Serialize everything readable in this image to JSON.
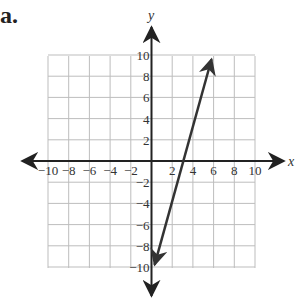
{
  "problem_label": "a.",
  "chart_data": {
    "type": "line",
    "title": "",
    "xlabel": "x",
    "ylabel": "y",
    "xlim": [
      -10,
      10
    ],
    "ylim": [
      -10,
      10
    ],
    "grid": true,
    "grid_step": 2,
    "x_ticks": [
      "−10",
      "−8",
      "−6",
      "−4",
      "−2",
      "2",
      "4",
      "6",
      "8",
      "10"
    ],
    "y_ticks": [
      "10",
      "8",
      "6",
      "4",
      "2",
      "−2",
      "−4",
      "−6",
      "−8",
      "−10"
    ],
    "series": [
      {
        "name": "line",
        "points": [
          [
            0.3,
            -9.8
          ],
          [
            3,
            0
          ],
          [
            5.8,
            9.6
          ]
        ],
        "arrows_both_ends": true,
        "color": "#333333"
      }
    ]
  }
}
